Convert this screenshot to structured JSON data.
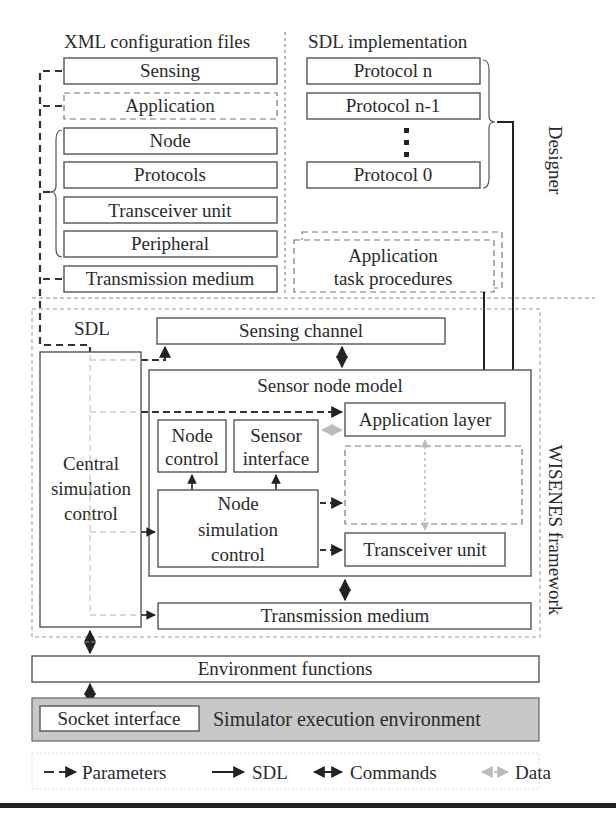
{
  "xml_section": {
    "title": "XML configuration files",
    "items": [
      "Sensing",
      "Application",
      "Node",
      "Protocols",
      "Transceiver unit",
      "Peripheral",
      "Transmission medium"
    ]
  },
  "sdl_section": {
    "title": "SDL implementation",
    "protocols": [
      "Protocol n",
      "Protocol n-1",
      "Protocol 0"
    ],
    "ellipsis": "⋮",
    "app_tasks_line1": "Application",
    "app_tasks_line2": "task procedures"
  },
  "side_labels": {
    "designer": "Designer",
    "framework": "WISENES framework"
  },
  "framework": {
    "sdl_label": "SDL",
    "sensing_channel": "Sensing channel",
    "central_line1": "Central",
    "central_line2": "simulation",
    "central_line3": "control",
    "sensor_node_model": "Sensor node model",
    "application_layer": "Application layer",
    "node_control_line1": "Node",
    "node_control_line2": "control",
    "sensor_interface_line1": "Sensor",
    "sensor_interface_line2": "interface",
    "node_sim_line1": "Node",
    "node_sim_line2": "simulation",
    "node_sim_line3": "control",
    "transceiver_unit": "Transceiver unit",
    "transmission_medium": "Transmission medium"
  },
  "environment": {
    "functions": "Environment functions",
    "socket_interface": "Socket interface",
    "execution_env": "Simulator execution environment",
    "execution_env_color": "#c8c8c8"
  },
  "legend": {
    "parameters": "Parameters",
    "sdl": "SDL",
    "commands": "Commands",
    "data": "Data"
  }
}
